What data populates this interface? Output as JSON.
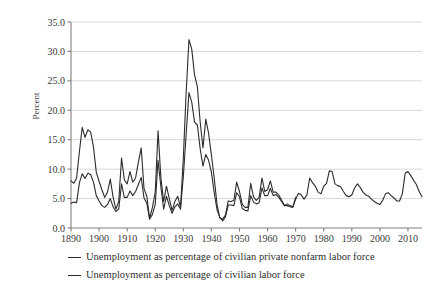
{
  "chart_data": {
    "type": "line",
    "title": "",
    "subtitle": "",
    "xlabel": "",
    "ylabel": "Percent",
    "xlim": [
      1890,
      2015
    ],
    "ylim": [
      0.0,
      35.0
    ],
    "grid": true,
    "grid_axis": "y",
    "legend_position": "below",
    "y_ticks": [
      "0.0",
      "5.0",
      "10.0",
      "15.0",
      "20.0",
      "25.0",
      "30.0",
      "35.0"
    ],
    "y_tick_values": [
      0.0,
      5.0,
      10.0,
      15.0,
      20.0,
      25.0,
      30.0,
      35.0
    ],
    "x_ticks": [
      "1890",
      "1900",
      "1910",
      "1920",
      "1930",
      "1940",
      "1950",
      "1960",
      "1970",
      "1980",
      "1990",
      "2000",
      "2010"
    ],
    "x_tick_values": [
      1890,
      1900,
      1910,
      1920,
      1930,
      1940,
      1950,
      1960,
      1970,
      1980,
      1990,
      2000,
      2010
    ],
    "line_color": "#2b2b2b",
    "grid_color": "#d8d8d8",
    "axis_color": "#808080",
    "series": [
      {
        "name": "Unemployment as percentage of civilian private nonfarm labor force",
        "x": [
          1890,
          1891,
          1892,
          1893,
          1894,
          1895,
          1896,
          1897,
          1898,
          1899,
          1900,
          1901,
          1902,
          1903,
          1904,
          1905,
          1906,
          1907,
          1908,
          1909,
          1910,
          1911,
          1912,
          1913,
          1914,
          1915,
          1916,
          1917,
          1918,
          1919,
          1920,
          1921,
          1922,
          1923,
          1924,
          1925,
          1926,
          1927,
          1928,
          1929,
          1930,
          1931,
          1932,
          1933,
          1934,
          1935,
          1936,
          1937,
          1938,
          1939,
          1940,
          1941,
          1942,
          1943,
          1944,
          1945,
          1946,
          1947,
          1948,
          1949,
          1950,
          1951,
          1952,
          1953,
          1954,
          1955,
          1956,
          1957,
          1958,
          1959,
          1960,
          1961,
          1962,
          1963,
          1964,
          1965,
          1966,
          1967,
          1968,
          1969,
          1970
        ],
        "values": [
          8.0,
          7.6,
          8.5,
          13.0,
          17.1,
          15.4,
          16.7,
          16.3,
          13.8,
          9.5,
          7.9,
          6.5,
          5.2,
          6.1,
          8.3,
          5.2,
          3.2,
          4.5,
          11.9,
          8.2,
          7.5,
          9.6,
          7.8,
          8.5,
          11.2,
          13.6,
          6.7,
          5.4,
          1.6,
          3.5,
          6.1,
          16.5,
          8.6,
          4.5,
          7.1,
          5.0,
          3.0,
          4.5,
          5.4,
          3.5,
          11.9,
          22.9,
          32.0,
          30.4,
          26.0,
          24.0,
          18.0,
          13.6,
          18.5,
          16.1,
          12.4,
          8.5,
          4.0,
          1.7,
          1.5,
          2.2,
          4.6,
          4.5,
          4.7,
          7.8,
          6.2,
          4.0,
          3.5,
          3.5,
          7.6,
          5.3,
          4.7,
          5.2,
          8.5,
          6.2,
          6.5,
          8.0,
          6.1,
          6.1,
          5.6,
          4.7,
          3.8,
          4.1,
          3.8,
          3.6,
          5.2
        ]
      },
      {
        "name": "Unemployment as percentage of civilian labor force",
        "x": [
          1890,
          1891,
          1892,
          1893,
          1894,
          1895,
          1896,
          1897,
          1898,
          1899,
          1900,
          1901,
          1902,
          1903,
          1904,
          1905,
          1906,
          1907,
          1908,
          1909,
          1910,
          1911,
          1912,
          1913,
          1914,
          1915,
          1916,
          1917,
          1918,
          1919,
          1920,
          1921,
          1922,
          1923,
          1924,
          1925,
          1926,
          1927,
          1928,
          1929,
          1930,
          1931,
          1932,
          1933,
          1934,
          1935,
          1936,
          1937,
          1938,
          1939,
          1940,
          1941,
          1942,
          1943,
          1944,
          1945,
          1946,
          1947,
          1948,
          1949,
          1950,
          1951,
          1952,
          1953,
          1954,
          1955,
          1956,
          1957,
          1958,
          1959,
          1960,
          1961,
          1962,
          1963,
          1964,
          1965,
          1966,
          1967,
          1968,
          1969,
          1970,
          1971,
          1972,
          1973,
          1974,
          1975,
          1976,
          1977,
          1978,
          1979,
          1980,
          1981,
          1982,
          1983,
          1984,
          1985,
          1986,
          1987,
          1988,
          1989,
          1990,
          1991,
          1992,
          1993,
          1994,
          1995,
          1996,
          1997,
          1998,
          1999,
          2000,
          2001,
          2002,
          2003,
          2004,
          2005,
          2006,
          2007,
          2008,
          2009,
          2010,
          2011,
          2012,
          2013,
          2014,
          2015
        ],
        "values": [
          4.2,
          4.4,
          4.3,
          7.7,
          9.2,
          8.4,
          9.3,
          9.1,
          7.8,
          5.5,
          4.6,
          3.8,
          3.5,
          4.0,
          5.0,
          3.6,
          2.8,
          3.2,
          7.5,
          5.2,
          5.2,
          6.3,
          5.5,
          6.2,
          7.4,
          8.6,
          5.1,
          4.2,
          1.5,
          2.3,
          4.0,
          11.5,
          7.0,
          3.2,
          5.4,
          3.8,
          2.5,
          3.6,
          4.1,
          3.2,
          8.7,
          15.9,
          23.0,
          21.4,
          18.0,
          17.5,
          13.5,
          10.5,
          12.5,
          11.5,
          9.5,
          6.0,
          3.1,
          1.8,
          1.2,
          1.9,
          3.9,
          3.9,
          3.8,
          6.0,
          5.3,
          3.3,
          3.0,
          2.9,
          5.5,
          4.4,
          4.1,
          4.3,
          6.8,
          5.5,
          5.5,
          6.7,
          5.5,
          5.7,
          5.2,
          4.5,
          3.8,
          3.8,
          3.6,
          3.5,
          4.9,
          5.9,
          5.6,
          4.9,
          5.6,
          8.5,
          7.7,
          7.1,
          6.1,
          5.8,
          7.1,
          7.6,
          9.7,
          9.6,
          7.5,
          7.2,
          7.0,
          6.2,
          5.5,
          5.3,
          5.6,
          6.8,
          7.5,
          6.9,
          6.1,
          5.6,
          5.4,
          4.9,
          4.5,
          4.2,
          4.0,
          4.7,
          5.8,
          6.0,
          5.5,
          5.1,
          4.6,
          4.6,
          5.8,
          9.3,
          9.6,
          8.9,
          8.1,
          7.4,
          6.2,
          5.3
        ]
      }
    ]
  },
  "legend": {
    "entries": [
      {
        "label": "Unemployment as percentage of civilian private nonfarm labor force"
      },
      {
        "label": "Unemployment as percentage of civilian labor force"
      }
    ]
  },
  "axis": {
    "y_title": "Percent"
  }
}
